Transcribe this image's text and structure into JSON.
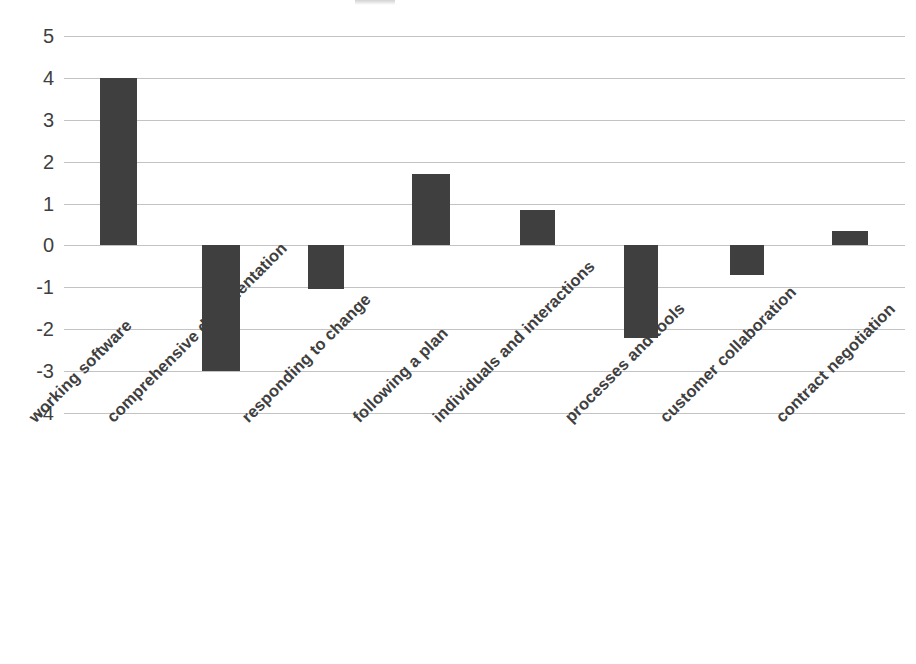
{
  "chart_data": {
    "type": "bar",
    "title": "",
    "subtitle": "",
    "xlabel": "",
    "ylabel": "",
    "ylim": [
      -4,
      5
    ],
    "ytick_values": [
      5,
      4,
      3,
      2,
      1,
      0,
      -1,
      -2,
      -3,
      -4
    ],
    "ytick_labels": [
      "5",
      "4",
      "3",
      "2",
      "1",
      "0",
      "-1",
      "-2",
      "-3",
      "-4"
    ],
    "grid": true,
    "grid_axis": "y",
    "legend": false,
    "legend_position": "none",
    "bar_color": "#3f3f3f",
    "gridline_color": "#b8b8b8",
    "categories": [
      "working software",
      "comprehensive documentation",
      "responding to change",
      "following a plan",
      "individuals and interactions",
      "processes and tools",
      "customer collaboration",
      "contract negotiation"
    ],
    "values": [
      4.0,
      -3.0,
      -1.05,
      1.7,
      0.85,
      -2.2,
      -0.7,
      0.35
    ],
    "xtick_rotation": -45,
    "bar_geometry": [
      {
        "label": "working software",
        "value": 4.0,
        "x": 100,
        "width": 37
      },
      {
        "label": "comprehensive documentation",
        "value": -3.0,
        "x": 202,
        "width": 38
      },
      {
        "label": "responding to change",
        "value": -1.05,
        "x": 308,
        "width": 36
      },
      {
        "label": "following a plan",
        "value": 1.7,
        "x": 412,
        "width": 38
      },
      {
        "label": "individuals and interactions",
        "value": 0.85,
        "x": 520,
        "width": 35
      },
      {
        "label": "processes and tools",
        "value": -2.2,
        "x": 624,
        "width": 34
      },
      {
        "label": "customer collaboration",
        "value": -0.7,
        "x": 730,
        "width": 34
      },
      {
        "label": "contract negotiation",
        "value": 0.35,
        "x": 832,
        "width": 36
      }
    ],
    "xlabel_positions": [
      {
        "text": "working software",
        "x": 25
      },
      {
        "text": "comprehensive documentation",
        "x": 103
      },
      {
        "text": "responding to change",
        "x": 238
      },
      {
        "text": "following a plan",
        "x": 349
      },
      {
        "text": "individuals and interactions",
        "x": 429
      },
      {
        "text": "processes and tools",
        "x": 561
      },
      {
        "text": "customer collaboration",
        "x": 656
      },
      {
        "text": "contract negotiation",
        "x": 772
      }
    ]
  }
}
